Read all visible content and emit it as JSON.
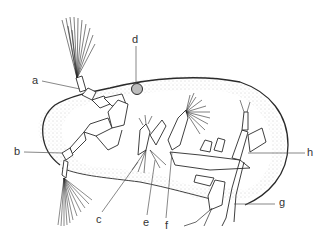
{
  "figure": {
    "colors": {
      "line": "#2a2a2a",
      "stipple": "#9a9a9a",
      "background": "#ffffff",
      "label": "#333333"
    },
    "labels": [
      {
        "id": "a",
        "text": "a"
      },
      {
        "id": "b",
        "text": "b"
      },
      {
        "id": "c",
        "text": "c"
      },
      {
        "id": "d",
        "text": "d"
      },
      {
        "id": "e",
        "text": "e"
      },
      {
        "id": "f",
        "text": "f"
      },
      {
        "id": "g",
        "text": "g"
      },
      {
        "id": "h",
        "text": "h"
      }
    ]
  }
}
